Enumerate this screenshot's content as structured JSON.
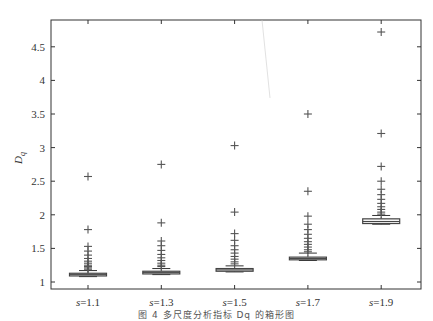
{
  "chart_data": {
    "type": "box",
    "title": "",
    "xlabel": "",
    "ylabel": "D_q",
    "ylim": [
      0.9,
      4.9
    ],
    "yticks": [
      1,
      1.5,
      2,
      2.5,
      3,
      3.5,
      4,
      4.5
    ],
    "ytick_labels": [
      "1",
      "1.5",
      "2",
      "2.5",
      "3",
      "3.5",
      "4",
      "4.5"
    ],
    "categories": [
      "s=1.1",
      "s=1.3",
      "s=1.5",
      "s=1.7",
      "s=1.9"
    ],
    "grid": false,
    "series": [
      {
        "name": "s=1.1",
        "q1": 1.09,
        "median": 1.11,
        "q3": 1.13,
        "whisker_low": 1.08,
        "whisker_high": 1.17,
        "outliers": [
          2.57,
          1.78,
          1.53,
          1.46,
          1.4,
          1.35,
          1.31,
          1.28,
          1.25,
          1.23,
          1.21,
          1.19
        ]
      },
      {
        "name": "s=1.3",
        "q1": 1.12,
        "median": 1.14,
        "q3": 1.16,
        "whisker_low": 1.11,
        "whisker_high": 1.2,
        "outliers": [
          2.75,
          1.88,
          1.61,
          1.54,
          1.47,
          1.41,
          1.36,
          1.32,
          1.28,
          1.25,
          1.23
        ]
      },
      {
        "name": "s=1.5",
        "q1": 1.16,
        "median": 1.18,
        "q3": 1.2,
        "whisker_low": 1.15,
        "whisker_high": 1.24,
        "outliers": [
          3.03,
          2.04,
          1.72,
          1.62,
          1.54,
          1.48,
          1.43,
          1.38,
          1.34,
          1.3,
          1.27
        ]
      },
      {
        "name": "s=1.7",
        "q1": 1.33,
        "median": 1.35,
        "q3": 1.37,
        "whisker_low": 1.32,
        "whisker_high": 1.43,
        "outliers": [
          3.5,
          2.35,
          1.98,
          1.86,
          1.78,
          1.71,
          1.65,
          1.6,
          1.56,
          1.52,
          1.48,
          1.45
        ]
      },
      {
        "name": "s=1.9",
        "q1": 1.87,
        "median": 1.9,
        "q3": 1.94,
        "whisker_low": 1.86,
        "whisker_high": 1.99,
        "outliers": [
          4.72,
          3.21,
          2.72,
          2.5,
          2.38,
          2.3,
          2.23,
          2.17,
          2.12,
          2.08,
          2.04,
          2.01
        ]
      }
    ]
  },
  "caption": "图 4   多尺度分析指标 Dq 的箱形图"
}
